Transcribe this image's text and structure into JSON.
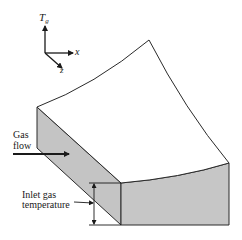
{
  "diagram": {
    "title": "",
    "axes": {
      "vertical": "T",
      "vertical_sub": "g",
      "horizontal": "x",
      "depth": "z"
    },
    "labels": {
      "gas_flow_line1": "Gas",
      "gas_flow_line2": "flow",
      "inlet_line1": "Inlet gas",
      "inlet_line2": "temperature"
    },
    "colors": {
      "face_fill": "#c4c4c4",
      "stroke": "#2a2a2a",
      "background": "#ffffff"
    }
  }
}
